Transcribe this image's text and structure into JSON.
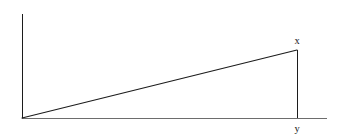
{
  "figure": {
    "background_color": "#ffffff",
    "canvas": {
      "width": 340,
      "height": 136
    },
    "labels": {
      "apex_label": "x",
      "base_label": "y"
    },
    "colors": {
      "line_dark": "#1c1c1c",
      "baseline_gray": "#6d6d6d",
      "text": "#161616"
    }
  },
  "chart_data": {
    "type": "line",
    "xlabel": "",
    "ylabel": "",
    "grid": false,
    "legend": "none",
    "annotations": [
      {
        "text": "x",
        "x": 297,
        "y": 44,
        "role": "apex-vertex-label"
      },
      {
        "text": "y",
        "x": 297,
        "y": 131,
        "role": "base-vertex-label"
      }
    ],
    "series": [
      {
        "name": "vertical-axis",
        "points": [
          {
            "x": 22,
            "y": 14
          },
          {
            "x": 22,
            "y": 118
          }
        ]
      },
      {
        "name": "horizontal-baseline",
        "points": [
          {
            "x": 22,
            "y": 118
          },
          {
            "x": 327,
            "y": 118
          }
        ]
      },
      {
        "name": "hypotenuse",
        "points": [
          {
            "x": 22,
            "y": 118
          },
          {
            "x": 297,
            "y": 50
          }
        ]
      },
      {
        "name": "drop-line",
        "points": [
          {
            "x": 297,
            "y": 50
          },
          {
            "x": 297,
            "y": 118
          }
        ]
      }
    ],
    "xlim": [
      0,
      340
    ],
    "ylim": [
      136,
      0
    ]
  }
}
